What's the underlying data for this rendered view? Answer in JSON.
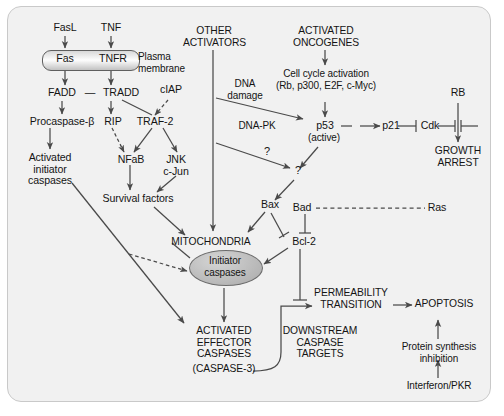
{
  "figure": {
    "panel_bg": "#f1f1f1",
    "line_color": "#4a4a4a",
    "text_color": "#141414"
  },
  "nodes": {
    "fasl": "FasL",
    "tnf": "TNF",
    "fas": "Fas",
    "tnfr": "TNFR",
    "plasma_membrane": "Plasma\nmembrane",
    "fadd": "FADD",
    "dash": "—",
    "tradd": "TRADD",
    "ciap": "cIAP",
    "procaspase": "Procaspase-β",
    "rip": "RIP",
    "traf2": "TRAF-2",
    "activated_initiator": "Activated\ninitiator\ncaspases",
    "nfab": "NFaB",
    "jnk": "JNK",
    "cjun": "c-Jun",
    "survival_factors": "Survival factors",
    "other_activators": "OTHER\nACTIVATORS",
    "dna_damage": "DNA\ndamage",
    "dna_pk": "DNA-PK",
    "q1": "?",
    "q2": "?",
    "activated_oncogenes": "ACTIVATED\nONCOGENES",
    "cell_cycle": "Cell cycle activation\n(Rb, p300, E2F, c-Myc)",
    "p53": "p53",
    "p53_state": "(active)",
    "p21": "p21",
    "cdk": "Cdk",
    "rb": "RB",
    "growth_arrest": "GROWTH\nARREST",
    "bax": "Bax",
    "bad": "Bad",
    "ras": "Ras",
    "bcl2": "Bcl-2",
    "mitochondria": "MITOCHONDRIA",
    "initiator_caspases": "Initiator\ncaspases",
    "activated_effector": "ACTIVATED\nEFFECTOR\nCASPASES",
    "caspase3": "(CASPASE-3)",
    "downstream_targets": "DOWNSTREAM\nCASPASE\nTARGETS",
    "permeability": "PERMEABILITY\nTRANSITION",
    "apoptosis": "APOPTOSIS",
    "protein_synthesis": "Protein synthesis\ninhibition",
    "interferon": "Interferon/PKR"
  },
  "edges": [
    {
      "from": "FasL",
      "to": "Fas",
      "style": "solid-arrow"
    },
    {
      "from": "TNF",
      "to": "TNFR",
      "style": "solid-arrow"
    },
    {
      "from": "Fas",
      "to": "FADD",
      "style": "solid-arrow"
    },
    {
      "from": "TNFR",
      "to": "TRADD",
      "style": "solid-arrow"
    },
    {
      "from": "FADD",
      "to": "Procaspase-β",
      "style": "solid-arrow"
    },
    {
      "from": "TRADD",
      "to": "RIP",
      "style": "solid-arrow"
    },
    {
      "from": "TRADD",
      "to": "TRAF-2",
      "style": "solid-line"
    },
    {
      "from": "cIAP",
      "to": "TRAF-2",
      "style": "dashed-arrow"
    },
    {
      "from": "Procaspase-β",
      "to": "Activated initiator caspases",
      "style": "solid-arrow"
    },
    {
      "from": "RIP",
      "to": "NFaB",
      "style": "dashed-arrow"
    },
    {
      "from": "TRAF-2",
      "to": "NFaB",
      "style": "solid-arrow"
    },
    {
      "from": "TRAF-2",
      "to": "JNK c-Jun",
      "style": "solid-arrow"
    },
    {
      "from": "NFaB",
      "to": "Survival factors",
      "style": "solid-arrow"
    },
    {
      "from": "JNK c-Jun",
      "to": "Survival factors",
      "style": "solid-arrow"
    },
    {
      "from": "Survival factors",
      "to": "MITOCHONDRIA",
      "style": "solid-arrow"
    },
    {
      "from": "Activated initiator caspases",
      "to": "ACTIVATED EFFECTOR CASPASES",
      "style": "solid-arrow"
    },
    {
      "from": "Activated initiator caspases",
      "to": "Initiator caspases",
      "style": "dashed-arrow"
    },
    {
      "from": "OTHER ACTIVATORS",
      "to": "MITOCHONDRIA",
      "style": "solid-arrow"
    },
    {
      "from": "DNA damage",
      "to": "p53",
      "style": "solid-arrow"
    },
    {
      "from": "DNA-PK",
      "to": "?",
      "style": "solid-arrow"
    },
    {
      "from": "ACTIVATED ONCOGENES",
      "to": "Cell cycle activation",
      "style": "solid-arrow"
    },
    {
      "from": "Cell cycle activation",
      "to": "p53",
      "style": "solid-arrow"
    },
    {
      "from": "p53",
      "to": "p21",
      "style": "solid-arrow"
    },
    {
      "from": "p21",
      "to": "Cdk",
      "style": "inhibition"
    },
    {
      "from": "Cdk",
      "to": "RB-pathway",
      "style": "inhibition"
    },
    {
      "from": "RB",
      "to": "GROWTH ARREST",
      "style": "solid-arrow"
    },
    {
      "from": "p53",
      "to": "?",
      "style": "solid-arrow"
    },
    {
      "from": "?",
      "to": "Bax",
      "style": "solid-arrow"
    },
    {
      "from": "Bax",
      "to": "MITOCHONDRIA",
      "style": "solid-arrow"
    },
    {
      "from": "Bax",
      "to": "Bcl-2",
      "style": "inhibition"
    },
    {
      "from": "Bad",
      "to": "Bcl-2",
      "style": "inhibition"
    },
    {
      "from": "Bad",
      "to": "Ras",
      "style": "dashed-line"
    },
    {
      "from": "Bcl-2",
      "to": "Initiator caspases",
      "style": "solid-arrow"
    },
    {
      "from": "Bcl-2",
      "to": "PERMEABILITY TRANSITION",
      "style": "inhibition"
    },
    {
      "from": "MITOCHONDRIA",
      "to": "Initiator caspases",
      "style": "region"
    },
    {
      "from": "Initiator caspases",
      "to": "ACTIVATED EFFECTOR CASPASES",
      "style": "solid-arrow"
    },
    {
      "from": "(CASPASE-3)",
      "to": "PERMEABILITY TRANSITION",
      "style": "curved-arrow"
    },
    {
      "from": "PERMEABILITY TRANSITION",
      "to": "APOPTOSIS",
      "style": "solid-arrow"
    },
    {
      "from": "Protein synthesis inhibition",
      "to": "APOPTOSIS",
      "style": "solid-arrow"
    },
    {
      "from": "Interferon/PKR",
      "to": "Protein synthesis inhibition",
      "style": "solid-arrow"
    }
  ]
}
